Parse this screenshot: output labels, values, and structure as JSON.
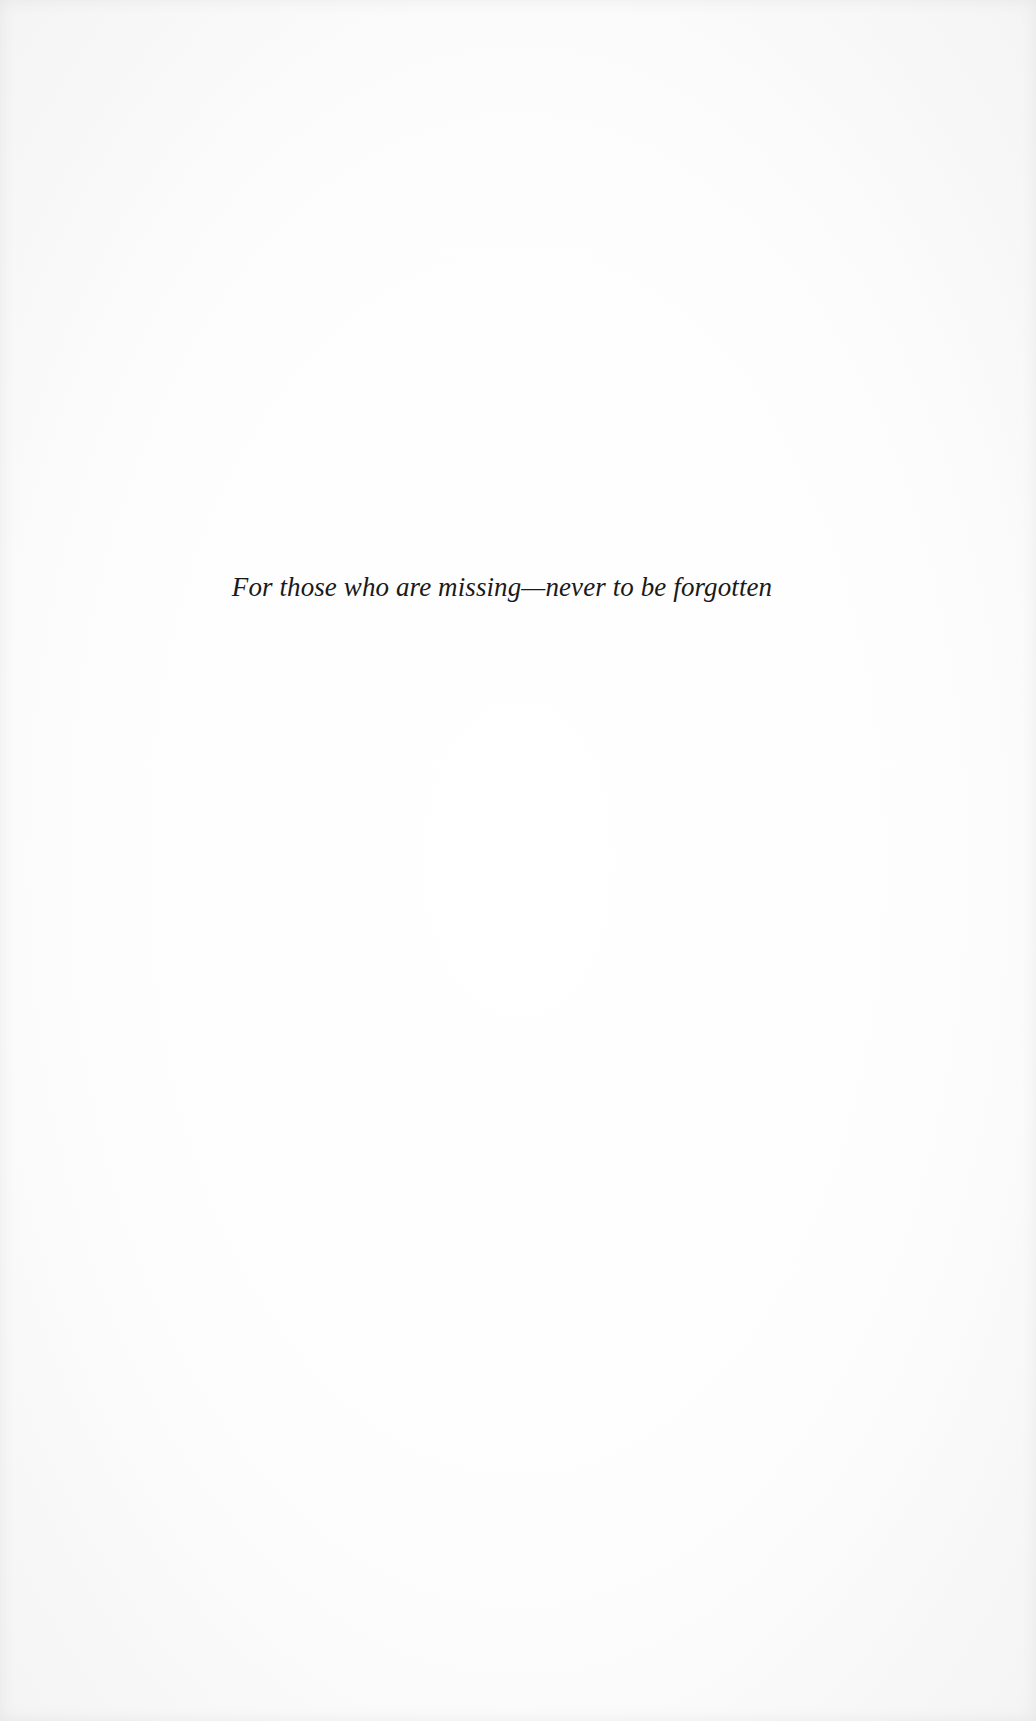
{
  "page": {
    "type": "dedication",
    "dedication_text": "For those who are missing—never to be forgotten"
  },
  "colors": {
    "paper": "#fbfbfb",
    "text": "#1a1a1a"
  }
}
